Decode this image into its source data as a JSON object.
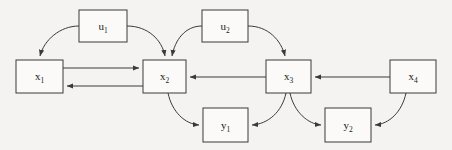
{
  "figure": {
    "type": "block-signal-flow-diagram",
    "background_color": "#f4f3f1",
    "line_color": "#3a3a3a",
    "box_fill_color": "#fbfaf8",
    "text_color": "#1a1a1a",
    "width": 452,
    "height": 150
  },
  "nodes": [
    {
      "id": "u1",
      "base": "u",
      "subscript": "1",
      "label": "u₁",
      "kind": "input",
      "x": 79,
      "y": 10,
      "w": 48,
      "h": 32
    },
    {
      "id": "u2",
      "base": "u",
      "subscript": "2",
      "label": "u₂",
      "kind": "input",
      "x": 202,
      "y": 10,
      "w": 46,
      "h": 32
    },
    {
      "id": "x1",
      "base": "x",
      "subscript": "1",
      "label": "x₁",
      "kind": "state",
      "x": 16,
      "y": 60,
      "w": 47,
      "h": 33
    },
    {
      "id": "x2",
      "base": "x",
      "subscript": "2",
      "label": "x₂",
      "kind": "state",
      "x": 143,
      "y": 60,
      "w": 43,
      "h": 33
    },
    {
      "id": "x3",
      "base": "x",
      "subscript": "3",
      "label": "x₃",
      "kind": "state",
      "x": 266,
      "y": 60,
      "w": 45,
      "h": 33
    },
    {
      "id": "x4",
      "base": "x",
      "subscript": "4",
      "label": "x₄",
      "kind": "state",
      "x": 390,
      "y": 60,
      "w": 46,
      "h": 33
    },
    {
      "id": "y1",
      "base": "y",
      "subscript": "1",
      "label": "y₁",
      "kind": "output",
      "x": 203,
      "y": 108,
      "w": 45,
      "h": 34
    },
    {
      "id": "y2",
      "base": "y",
      "subscript": "2",
      "label": "y₂",
      "kind": "output",
      "x": 325,
      "y": 108,
      "w": 46,
      "h": 34
    }
  ],
  "edges": [
    {
      "id": "u1-to-x1",
      "from": "u1",
      "to": "x1",
      "shape": "curve",
      "path": "M 79 26 C 60 26 44 40 40 56"
    },
    {
      "id": "u1-to-x2",
      "from": "u1",
      "to": "x2",
      "shape": "curve",
      "path": "M 127 26 C 148 26 162 40 165 56"
    },
    {
      "id": "u2-to-x2",
      "from": "u2",
      "to": "x2",
      "shape": "curve",
      "path": "M 202 26 C 185 26 175 40 172 56"
    },
    {
      "id": "u2-to-x3",
      "from": "u2",
      "to": "x3",
      "shape": "curve",
      "path": "M 248 26 C 268 26 281 40 285 56"
    },
    {
      "id": "x1-to-x2",
      "from": "x1",
      "to": "x2",
      "shape": "line",
      "path": "M 63 68 L 139 68"
    },
    {
      "id": "x2-to-x1",
      "from": "x2",
      "to": "x1",
      "shape": "line",
      "path": "M 143 86 L 67 86"
    },
    {
      "id": "x3-to-x2",
      "from": "x3",
      "to": "x2",
      "shape": "line",
      "path": "M 266 77 L 190 77"
    },
    {
      "id": "x4-to-x3",
      "from": "x4",
      "to": "x3",
      "shape": "line",
      "path": "M 390 77 L 315 77"
    },
    {
      "id": "x2-to-y1",
      "from": "x2",
      "to": "y1",
      "shape": "curve",
      "path": "M 168 93 C 172 112 185 124 199 125"
    },
    {
      "id": "x3-to-y1",
      "from": "x3",
      "to": "y1",
      "shape": "curve",
      "path": "M 286 93 C 282 112 268 124 252 125"
    },
    {
      "id": "x3-to-y2",
      "from": "x3",
      "to": "y2",
      "shape": "curve",
      "path": "M 290 93 C 294 112 308 124 321 125"
    },
    {
      "id": "x4-to-y2",
      "from": "x4",
      "to": "y2",
      "shape": "curve",
      "path": "M 406 93 C 402 112 389 124 375 125"
    }
  ]
}
